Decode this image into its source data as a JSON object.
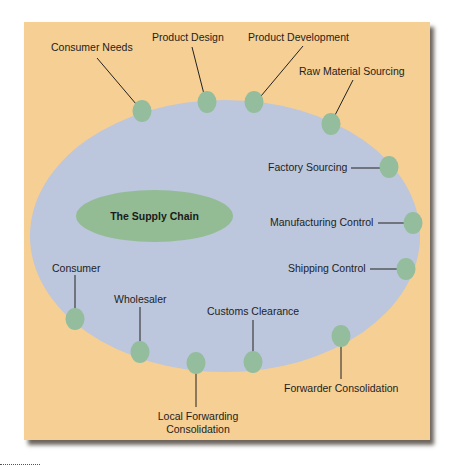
{
  "diagram": {
    "title": "The Supply Chain",
    "colors": {
      "background_panel": "#f5cf94",
      "outer_ellipse": "#bcc6dc",
      "nodes": "#93bd9d",
      "title_ellipse": "#93bc95"
    },
    "stages": [
      {
        "label": "Consumer Needs"
      },
      {
        "label": "Product Design"
      },
      {
        "label": "Product Development"
      },
      {
        "label": "Raw Material Sourcing"
      },
      {
        "label": "Factory Sourcing"
      },
      {
        "label": "Manufacturing Control"
      },
      {
        "label": "Shipping Control"
      },
      {
        "label": "Forwarder Consolidation"
      },
      {
        "label": "Customs Clearance"
      },
      {
        "label": "Local Forwarding",
        "label2": "Consolidation"
      },
      {
        "label": "Wholesaler"
      },
      {
        "label": "Consumer"
      }
    ]
  }
}
